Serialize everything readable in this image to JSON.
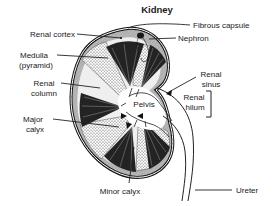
{
  "figure": {
    "title": "Kidney",
    "labels": {
      "fibrous_capsule": "Fibrous capsule",
      "nephron": "Nephron",
      "renal_cortex": "Renal cortex",
      "medulla_line1": "Medulla",
      "medulla_line2": "(pyramid)",
      "renal_column_line1": "Renal",
      "renal_column_line2": "column",
      "renal_sinus_line1": "Renal",
      "renal_sinus_line2": "sinus",
      "renal_hilum_line1": "Renal",
      "renal_hilum_line2": "hilum",
      "pelvis": "Pelvis",
      "major_calyx_line1": "Major",
      "major_calyx_line2": "calyx",
      "minor_calyx": "Minor calyx",
      "ureter": "Ureter"
    },
    "colors": {
      "background": "#ffffff",
      "ink": "#1a1a1a",
      "cortex_gray": "#b7b7b7",
      "pyramid_dark": "#232323",
      "stipple_dot": "#3a3a3a",
      "sinus_white": "#ffffff"
    }
  }
}
